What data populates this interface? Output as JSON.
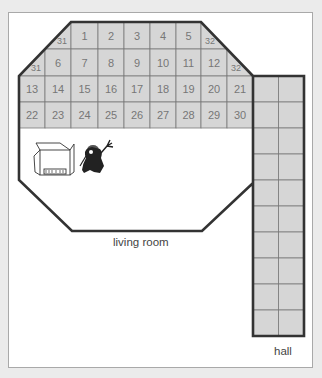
{
  "diagram": {
    "colors": {
      "tile_fill": "#d6d6d6",
      "grid_line": "#7a7a7a",
      "wall": "#333333",
      "tile_text": "#777777",
      "frame_border": "#a9a9a9",
      "background": "#ebebeb"
    },
    "labels": {
      "living_room": "living room",
      "hall": "hall"
    },
    "grid": {
      "x": [
        19,
        45,
        71,
        98,
        124,
        150,
        176,
        201,
        227,
        253,
        279,
        304
      ],
      "y": [
        22,
        49,
        76,
        102,
        128
      ]
    },
    "tiles": [
      {
        "row": 0,
        "col": 1,
        "label": "31",
        "partial": "lower-right-triangle"
      },
      {
        "row": 0,
        "col": 2,
        "label": "1"
      },
      {
        "row": 0,
        "col": 3,
        "label": "2"
      },
      {
        "row": 0,
        "col": 4,
        "label": "3"
      },
      {
        "row": 0,
        "col": 5,
        "label": "4"
      },
      {
        "row": 0,
        "col": 6,
        "label": "5"
      },
      {
        "row": 0,
        "col": 7,
        "label": "32",
        "partial": "lower-left-triangle"
      },
      {
        "row": 1,
        "col": 0,
        "label": "31",
        "partial": "lower-right-triangle"
      },
      {
        "row": 1,
        "col": 1,
        "label": "6"
      },
      {
        "row": 1,
        "col": 2,
        "label": "7"
      },
      {
        "row": 1,
        "col": 3,
        "label": "8"
      },
      {
        "row": 1,
        "col": 4,
        "label": "9"
      },
      {
        "row": 1,
        "col": 5,
        "label": "10"
      },
      {
        "row": 1,
        "col": 6,
        "label": "11"
      },
      {
        "row": 1,
        "col": 7,
        "label": "12"
      },
      {
        "row": 1,
        "col": 8,
        "label": "32",
        "partial": "lower-left-triangle"
      },
      {
        "row": 2,
        "col": 0,
        "label": "13"
      },
      {
        "row": 2,
        "col": 1,
        "label": "14"
      },
      {
        "row": 2,
        "col": 2,
        "label": "15"
      },
      {
        "row": 2,
        "col": 3,
        "label": "16"
      },
      {
        "row": 2,
        "col": 4,
        "label": "17"
      },
      {
        "row": 2,
        "col": 5,
        "label": "18"
      },
      {
        "row": 2,
        "col": 6,
        "label": "19"
      },
      {
        "row": 2,
        "col": 7,
        "label": "20"
      },
      {
        "row": 2,
        "col": 8,
        "label": "21"
      },
      {
        "row": 3,
        "col": 0,
        "label": "22"
      },
      {
        "row": 3,
        "col": 1,
        "label": "23"
      },
      {
        "row": 3,
        "col": 2,
        "label": "24"
      },
      {
        "row": 3,
        "col": 3,
        "label": "25"
      },
      {
        "row": 3,
        "col": 4,
        "label": "26"
      },
      {
        "row": 3,
        "col": 5,
        "label": "27"
      },
      {
        "row": 3,
        "col": 6,
        "label": "28"
      },
      {
        "row": 3,
        "col": 7,
        "label": "29"
      },
      {
        "row": 3,
        "col": 8,
        "label": "30"
      }
    ],
    "hall": {
      "x": 253,
      "width": 51,
      "top": 76,
      "bottom": 336,
      "rows": 10,
      "cols": 2
    },
    "icons": [
      "box-icon",
      "gnome-worker-icon"
    ]
  }
}
